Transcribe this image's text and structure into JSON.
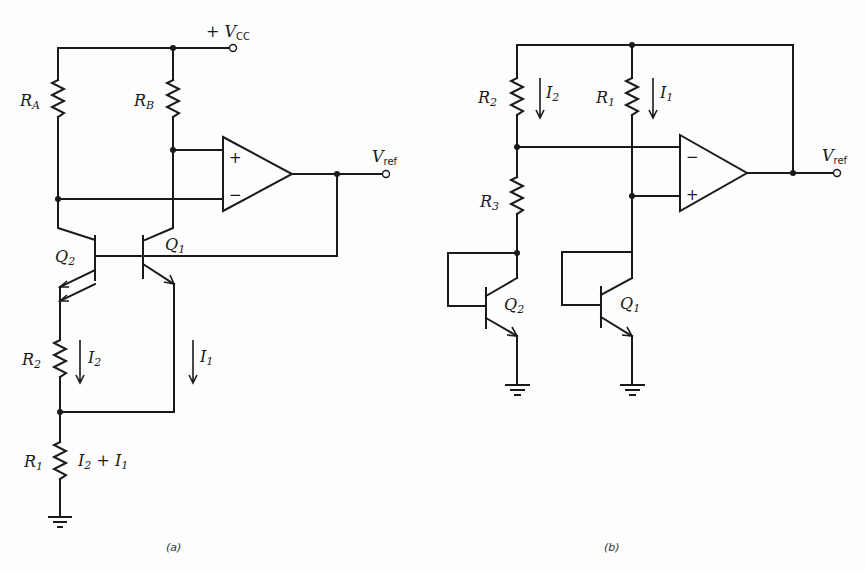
{
  "figure": {
    "panel_a": {
      "caption": "(a)",
      "supply_label": "+ V",
      "supply_sub": "CC",
      "output_label": "V",
      "output_sub": "ref",
      "resistors": {
        "ra": {
          "name": "R",
          "sub": "A"
        },
        "rb": {
          "name": "R",
          "sub": "B"
        },
        "r2": {
          "name": "R",
          "sub": "2"
        },
        "r1": {
          "name": "R",
          "sub": "1"
        }
      },
      "transistors": {
        "q1": {
          "name": "Q",
          "sub": "1"
        },
        "q2": {
          "name": "Q",
          "sub": "2"
        }
      },
      "currents": {
        "i2": {
          "name": "I",
          "sub": "2"
        },
        "i1": {
          "name": "I",
          "sub": "1"
        },
        "sum": {
          "a": "I",
          "a_sub": "2",
          "op": " + ",
          "b": "I",
          "b_sub": "1"
        }
      },
      "opamp": {
        "plus": "+",
        "minus": "−"
      }
    },
    "panel_b": {
      "caption": "(b)",
      "output_label": "V",
      "output_sub": "ref",
      "resistors": {
        "r2": {
          "name": "R",
          "sub": "2"
        },
        "r1": {
          "name": "R",
          "sub": "1"
        },
        "r3": {
          "name": "R",
          "sub": "3"
        }
      },
      "transistors": {
        "q2": {
          "name": "Q",
          "sub": "2"
        },
        "q1": {
          "name": "Q",
          "sub": "1"
        }
      },
      "currents": {
        "i2": {
          "name": "I",
          "sub": "2"
        },
        "i1": {
          "name": "I",
          "sub": "1"
        }
      },
      "opamp": {
        "minus": "−",
        "plus": "+"
      }
    }
  }
}
